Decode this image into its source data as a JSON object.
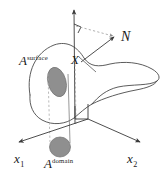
{
  "figure": {
    "background_color": "#ffffff",
    "line_color": "#4a4a4a",
    "axis_color": "#3a3a3a",
    "patch_fill": "#8f8f8f",
    "patch_stroke": "#6b6b6b",
    "dashed_color": "#9a9a9a",
    "width": 166,
    "height": 178
  },
  "labels": {
    "normal_vector": "N",
    "point": "X",
    "area_surface_base": "A",
    "area_surface_sup": "surface",
    "area_domain_base": "A",
    "area_domain_sup": "domain",
    "axis_x1_base": "x",
    "axis_x1_sub": "1",
    "axis_x2_base": "x",
    "axis_x2_sub": "2"
  },
  "geometry": {
    "origin": {
      "x": 88,
      "y": 119
    },
    "vertical_axis_tip": {
      "x": 74,
      "y": 6
    },
    "normal_arrow_tip": {
      "x": 116,
      "y": 35
    },
    "normal_arrow_base": {
      "x": 81,
      "y": 62
    },
    "x1_arrow_tip": {
      "x": 16,
      "y": 143
    },
    "x2_arrow_tip": {
      "x": 143,
      "y": 143
    },
    "right_angle_marker": {
      "x": 74,
      "y": 24,
      "size": 7
    },
    "surface_patch_center": {
      "x": 57,
      "y": 82
    },
    "domain_patch_center": {
      "x": 60,
      "y": 147
    }
  }
}
